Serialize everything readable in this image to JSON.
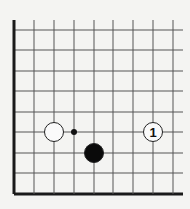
{
  "diagram": {
    "type": "go-board-corner",
    "corner": "bottom-left",
    "background": "#f4f4f2",
    "line_color": "#555555",
    "edge_color": "#1a1a1a",
    "grid": {
      "x_lines": [
        14,
        34,
        54,
        74,
        94,
        113,
        133,
        153,
        173
      ],
      "y_lines": [
        30,
        50,
        71,
        91,
        112,
        132,
        153,
        173,
        194
      ],
      "top": 20,
      "right": 183
    },
    "stones": [
      {
        "color": "white",
        "x": 54,
        "y": 132,
        "label": ""
      },
      {
        "color": "black",
        "x": 94,
        "y": 153,
        "label": ""
      },
      {
        "color": "white",
        "x": 153,
        "y": 132,
        "label": "1"
      }
    ],
    "markers": [
      {
        "type": "dot",
        "x": 74,
        "y": 132
      }
    ]
  }
}
